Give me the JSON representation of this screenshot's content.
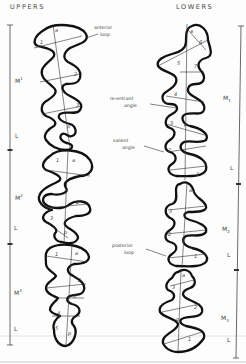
{
  "headers": {
    "uppers": "UPPERS",
    "lowers": "LOWERS"
  },
  "annotations": {
    "anterior_loop": [
      "anterior",
      "loop"
    ],
    "reentrant_angle": [
      "re-entrant",
      "angle"
    ],
    "salient_angle": [
      "salient",
      "angle"
    ],
    "posterior_loop": [
      "posterior",
      "loop"
    ]
  },
  "upper_scale": {
    "segments": [
      {
        "label": "M",
        "sup": "1",
        "type": "molar"
      },
      {
        "label": "L",
        "type": "loop"
      },
      {
        "label": "M",
        "sup": "2",
        "type": "molar"
      },
      {
        "label": "L",
        "type": "loop"
      },
      {
        "label": "M",
        "sup": "3",
        "type": "molar"
      },
      {
        "label": "L",
        "type": "loop"
      }
    ]
  },
  "lower_scale": {
    "segments": [
      {
        "label": "M",
        "sub": "1",
        "type": "molar"
      },
      {
        "label": "L",
        "type": "loop"
      },
      {
        "label": "M",
        "sub": "2",
        "type": "molar"
      },
      {
        "label": "L",
        "type": "loop"
      },
      {
        "label": "M",
        "sub": "3",
        "type": "molar"
      },
      {
        "label": "L",
        "type": "loop"
      }
    ]
  },
  "upper_teeth": [
    {
      "name": "M1",
      "markers": [
        "a",
        "1",
        "2",
        "3",
        "p"
      ]
    },
    {
      "name": "M2",
      "markers": [
        "a",
        "1",
        "2",
        "3",
        "p"
      ]
    },
    {
      "name": "M3",
      "markers": [
        "a",
        "1",
        "2",
        "3",
        "4",
        "5",
        "p"
      ]
    }
  ],
  "lower_teeth": [
    {
      "name": "M1",
      "markers": [
        "a",
        "6",
        "5",
        "7",
        "4",
        "3",
        "p",
        "2",
        "1"
      ]
    },
    {
      "name": "M2",
      "markers": [
        "a",
        "3",
        "2",
        "p",
        "1"
      ]
    },
    {
      "name": "M3",
      "markers": [
        "a",
        "3",
        "2",
        "p",
        "1"
      ]
    }
  ]
}
